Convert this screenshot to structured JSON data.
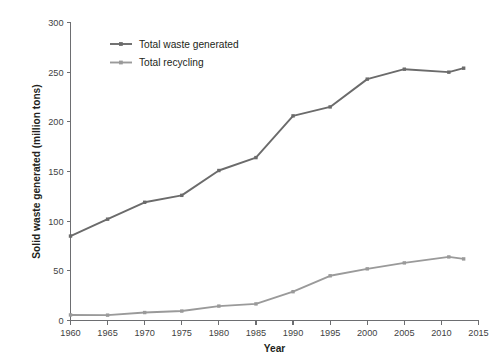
{
  "chart_data": {
    "type": "line",
    "title": "",
    "xlabel": "Year",
    "ylabel": "Solid waste generated (million tons)",
    "xlim": [
      1960,
      2015
    ],
    "ylim": [
      0,
      300
    ],
    "grid": false,
    "legend_position": "top-left",
    "x_ticks": [
      "1960",
      "1965",
      "1970",
      "1975",
      "1980",
      "1985",
      "1990",
      "1995",
      "2000",
      "2005",
      "2010",
      "2015"
    ],
    "y_ticks": [
      "0",
      "50",
      "100",
      "150",
      "200",
      "250",
      "300"
    ],
    "series": [
      {
        "name": "Total waste generated",
        "color": "#6b6b6b",
        "x": [
          1960,
          1965,
          1970,
          1975,
          1980,
          1985,
          1990,
          1995,
          2000,
          2005,
          2011,
          2013
        ],
        "values": [
          85,
          102,
          119,
          126,
          151,
          164,
          206,
          215,
          243,
          253,
          250,
          254
        ]
      },
      {
        "name": "Total recycling",
        "color": "#9a9a9a",
        "x": [
          1960,
          1965,
          1970,
          1975,
          1980,
          1985,
          1990,
          1995,
          2000,
          2005,
          2011,
          2013
        ],
        "values": [
          5.6,
          5.4,
          8,
          9.5,
          14.5,
          16.7,
          29,
          45,
          52,
          58,
          64,
          62
        ]
      }
    ]
  },
  "legend": {
    "items": [
      {
        "label": "Total waste generated"
      },
      {
        "label": "Total recycling"
      }
    ]
  },
  "axes": {
    "x_title": "Year",
    "y_title": "Solid waste generated (million tons)"
  }
}
